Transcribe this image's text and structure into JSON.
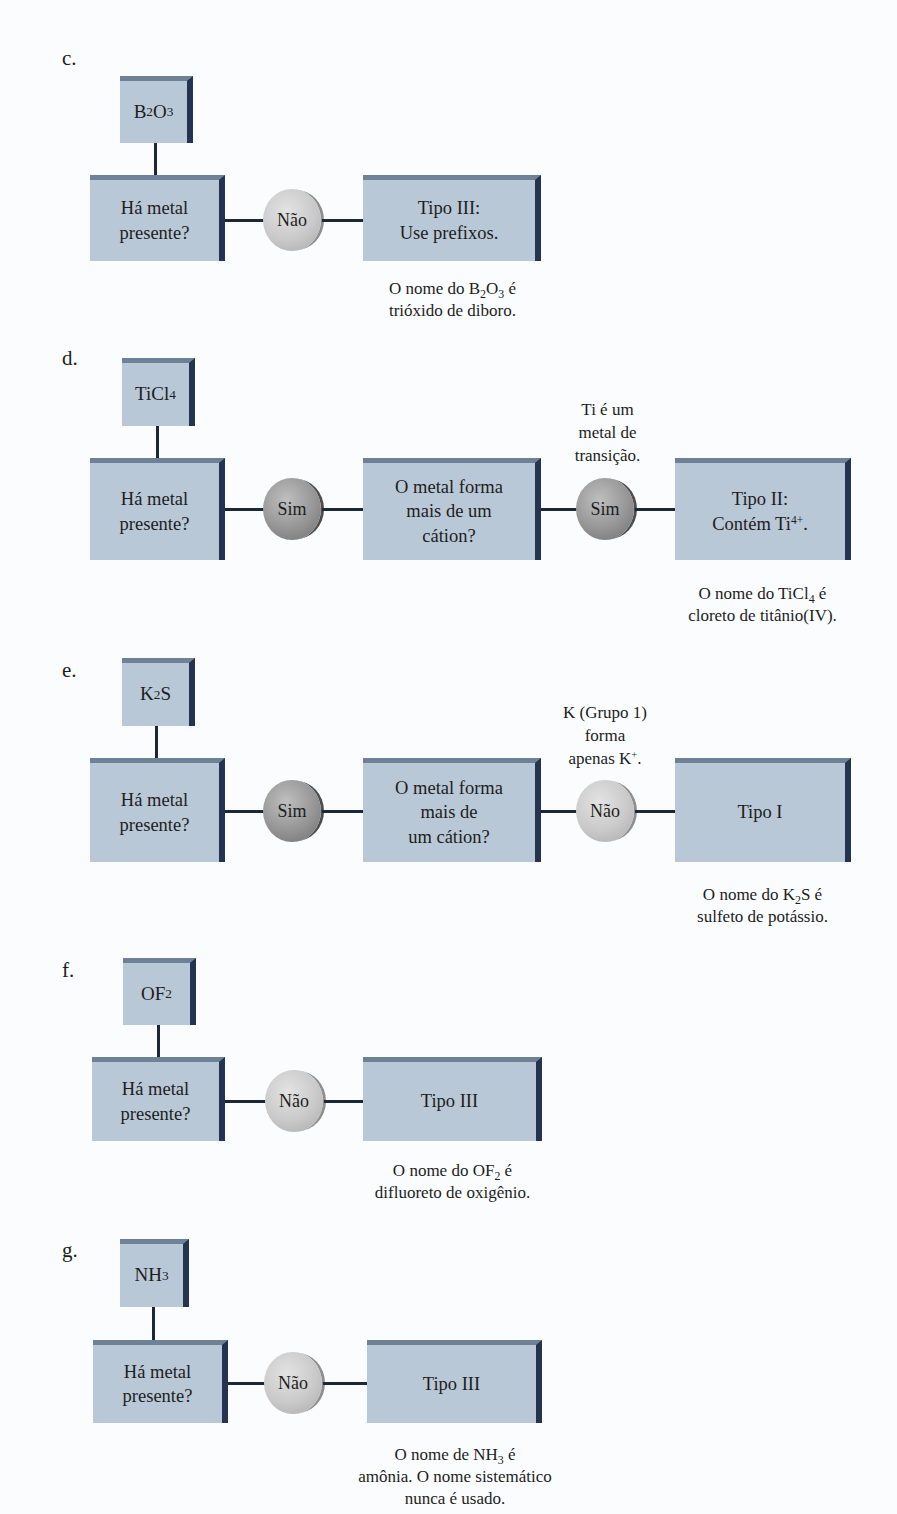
{
  "colors": {
    "box_face": "#b9c8d6",
    "box_top_edge": "#6e8196",
    "box_right_edge": "#24334f",
    "circle_nao": "#c9c9c9",
    "circle_sim": "#959595",
    "connector": "#1c2838"
  },
  "parts": [
    {
      "label": "c.",
      "formula": {
        "main": "B",
        "sub1": "2",
        "mid": "O",
        "sub2": "3"
      },
      "question_box": "Há metal presente?",
      "q1_line1": "Há metal",
      "q1_line2": "presente?",
      "answer1": "Não",
      "result_line1": "Tipo III:",
      "result_line2": "Use prefixos.",
      "note_line1_pre": "O nome do B",
      "note_line1_sub1": "2",
      "note_line1_mid": "O",
      "note_line1_sub2": "3",
      "note_line1_post": " é",
      "note_line2": "trióxido de diboro."
    },
    {
      "label": "d.",
      "formula": {
        "main": "TiCl",
        "sub1": "4"
      },
      "q1_line1": "Há metal",
      "q1_line2": "presente?",
      "answer1": "Sim",
      "q2_line1": "O metal forma",
      "q2_line2": "mais de um",
      "q2_line3": "cátion?",
      "annotation_line1": "Ti é um",
      "annotation_line2": "metal de",
      "annotation_line3": "transição.",
      "answer2": "Sim",
      "result_line1": "Tipo II:",
      "result_line2_pre": "Contém Ti",
      "result_line2_sup": "4+",
      "result_line2_post": ".",
      "note_line1_pre": "O nome do TiCl",
      "note_line1_sub1": "4",
      "note_line1_post": " é",
      "note_line2": "cloreto de titânio(IV)."
    },
    {
      "label": "e.",
      "formula": {
        "main": "K",
        "sub1": "2",
        "post": "S"
      },
      "q1_line1": "Há metal",
      "q1_line2": "presente?",
      "answer1": "Sim",
      "q2_line1": "O metal forma",
      "q2_line2": "mais de",
      "q2_line3": "um cátion?",
      "annotation_line1": "K (Grupo 1)",
      "annotation_line2": "forma",
      "annotation_line3_pre": "apenas K",
      "annotation_line3_sup": "+",
      "annotation_line3_post": ".",
      "answer2": "Não",
      "result_line1": "Tipo I",
      "note_line1_pre": "O nome do K",
      "note_line1_sub1": "2",
      "note_line1_post": "S é",
      "note_line2": "sulfeto de potássio."
    },
    {
      "label": "f.",
      "formula": {
        "main": "OF",
        "sub1": "2"
      },
      "q1_line1": "Há metal",
      "q1_line2": "presente?",
      "answer1": "Não",
      "result_line1": "Tipo III",
      "note_line1_pre": "O nome do OF",
      "note_line1_sub1": "2",
      "note_line1_post": " é",
      "note_line2": "difluoreto de oxigênio."
    },
    {
      "label": "g.",
      "formula": {
        "main": "NH",
        "sub1": "3"
      },
      "q1_line1": "Há metal",
      "q1_line2": "presente?",
      "answer1": "Não",
      "result_line1": "Tipo III",
      "note_line1_pre": "O nome de NH",
      "note_line1_sub1": "3",
      "note_line1_post": " é",
      "note_line2": "amônia. O nome sistemático",
      "note_line3": "nunca é usado."
    }
  ]
}
